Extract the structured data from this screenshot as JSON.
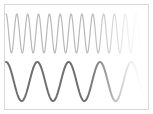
{
  "figure": {
    "background_color": "#ffffff",
    "frame_color": "#d8d8d8",
    "width": 153,
    "height": 114
  },
  "chart_data": {
    "type": "line",
    "title": "",
    "subtitle": "",
    "xlabel": "",
    "ylabel": "",
    "grid": false,
    "legend": false,
    "axes_visible": false,
    "tick_labels_visible": false,
    "xlim": [
      0,
      1
    ],
    "ylim": [
      -1,
      1
    ],
    "series": [
      {
        "name": "high-frequency-wave",
        "color": "#b8b8b8",
        "line_width": 1.2,
        "cycles": 13,
        "amplitude": 1.0,
        "phase_deg": 90,
        "baseline_y": 33.5,
        "amplitude_px": 19.5,
        "x_start": 6,
        "x_end": 147,
        "fade_start_fraction": 0.72,
        "fade_end_fraction": 1.0,
        "fade_end_opacity": 0.0
      },
      {
        "name": "low-frequency-wave",
        "color": "#6f6f6f",
        "line_width": 2.0,
        "cycles": 4.5,
        "amplitude": 1.0,
        "phase_deg": 90,
        "baseline_y": 81.5,
        "amplitude_px": 19.5,
        "x_start": 6,
        "x_end": 147,
        "fade_start_fraction": 0.72,
        "fade_end_fraction": 1.0,
        "fade_end_opacity": 0.0
      }
    ]
  }
}
